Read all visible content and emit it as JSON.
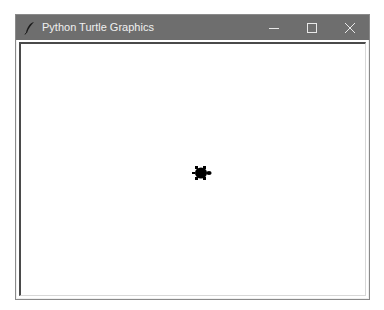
{
  "window": {
    "title": "Python Turtle Graphics",
    "app_icon": "feather-icon",
    "controls": [
      {
        "name": "minimize",
        "icon": "minimize-icon"
      },
      {
        "name": "maximize",
        "icon": "maximize-icon"
      },
      {
        "name": "close",
        "icon": "close-icon"
      }
    ],
    "titlebar_color": "#6e6e6e"
  },
  "canvas": {
    "background": "#ffffff",
    "turtle": {
      "shape": "turtle",
      "color": "#000000",
      "heading": "east"
    }
  }
}
